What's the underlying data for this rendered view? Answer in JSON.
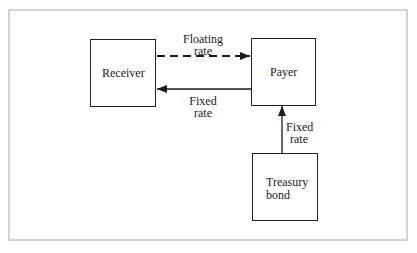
{
  "diagram": {
    "type": "interest-rate-swap-flow",
    "nodes": {
      "receiver": {
        "label": "Receiver"
      },
      "payer": {
        "label": "Payer"
      },
      "treasury": {
        "label_line1": "Treasury",
        "label_line2": "bond"
      }
    },
    "edges": {
      "floating": {
        "from": "receiver",
        "to": "payer",
        "style": "dashed",
        "label_line1": "Floating",
        "label_line2": "rate"
      },
      "fixed_to_receiver": {
        "from": "payer",
        "to": "receiver",
        "style": "solid",
        "label_line1": "Fixed",
        "label_line2": "rate"
      },
      "fixed_from_bond": {
        "from": "treasury",
        "to": "payer",
        "style": "solid",
        "label_line1": "Fixed",
        "label_line2": "rate"
      }
    },
    "colors": {
      "line": "#1a1a1a",
      "frame": "#d4d4d4",
      "background": "#ffffff"
    }
  }
}
